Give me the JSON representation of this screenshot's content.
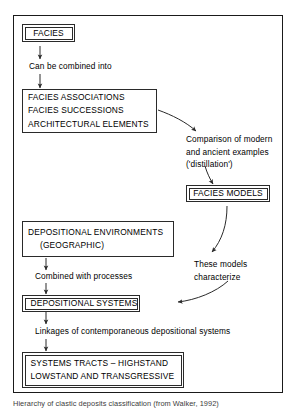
{
  "figure": {
    "caption": "Hierarchy of clastic deposits classification (from Walker, 1992)",
    "nodes": {
      "facies": {
        "lines": [
          "FACIES"
        ]
      },
      "facies_associations": {
        "lines": [
          "FACIES ASSOCIATIONS",
          "FACIES SUCCESSIONS",
          "ARCHITECTURAL ELEMENTS"
        ]
      },
      "facies_models": {
        "lines": [
          "FACIES MODELS"
        ]
      },
      "depositional_environments": {
        "lines": [
          "DEPOSITIONAL ENVIRONMENTS",
          "(GEOGRAPHIC)"
        ]
      },
      "depositional_systems": {
        "lines": [
          "DEPOSITIONAL SYSTEMS"
        ]
      },
      "systems_tracts": {
        "lines": [
          "SYSTEMS TRACTS – HIGHSTAND",
          "LOWSTAND AND TRANSGRESSIVE"
        ]
      }
    },
    "connector_labels": {
      "can_be_combined": "Can be combined into",
      "comparison": [
        "Comparison of modern",
        "and ancient examples",
        "('distillation')"
      ],
      "these_models": [
        "These models",
        "characterize"
      ],
      "combined_with_processes": "Combined with processes",
      "linkages": "Linkages of contemporaneous depositional systems"
    },
    "colors": {
      "stroke": "#2a2a2a",
      "frame": "#1a1a1a",
      "text": "#000000",
      "background": "#ffffff"
    }
  }
}
